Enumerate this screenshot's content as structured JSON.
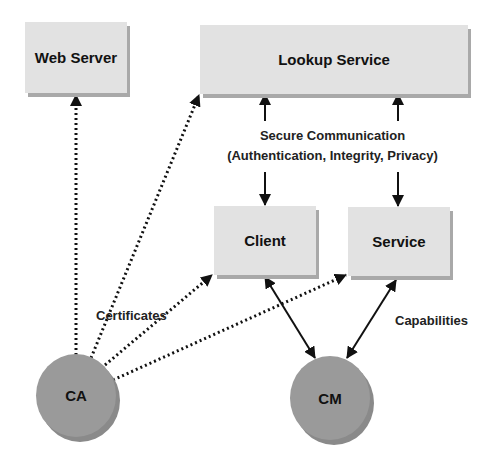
{
  "diagram": {
    "nodes": {
      "web_server": {
        "label": "Web Server",
        "shape": "box"
      },
      "lookup_service": {
        "label": "Lookup Service",
        "shape": "box"
      },
      "client": {
        "label": "Client",
        "shape": "box"
      },
      "service": {
        "label": "Service",
        "shape": "box"
      },
      "ca": {
        "label": "CA",
        "shape": "circle"
      },
      "cm": {
        "label": "CM",
        "shape": "circle"
      }
    },
    "labels": {
      "secure_comm_line1": "Secure Communication",
      "secure_comm_line2": "(Authentication, Integrity, Privacy)",
      "certificates": "Certificates",
      "capabilities": "Capabilities"
    },
    "edges": [
      {
        "from": "ca",
        "to": "web_server",
        "style": "dotted",
        "arrow": "end"
      },
      {
        "from": "ca",
        "to": "lookup_service",
        "style": "dotted",
        "arrow": "end"
      },
      {
        "from": "ca",
        "to": "client",
        "style": "dotted",
        "arrow": "end"
      },
      {
        "from": "ca",
        "to": "service",
        "style": "dotted",
        "arrow": "end"
      },
      {
        "from": "secure_comm",
        "to": "lookup_service",
        "style": "solid",
        "arrow": "end"
      },
      {
        "from": "secure_comm",
        "to": "client",
        "style": "solid",
        "arrow": "end"
      },
      {
        "from": "secure_comm",
        "to": "service",
        "style": "solid",
        "arrow": "end"
      },
      {
        "from": "client",
        "to": "cm",
        "style": "solid",
        "arrow": "both"
      },
      {
        "from": "service",
        "to": "cm",
        "style": "solid",
        "arrow": "both"
      }
    ],
    "colors": {
      "box_fill": "#e2e2e2",
      "box_shadow": "#a9a9a9",
      "circle_fill": "#9a9a9a",
      "line": "#111111"
    }
  }
}
